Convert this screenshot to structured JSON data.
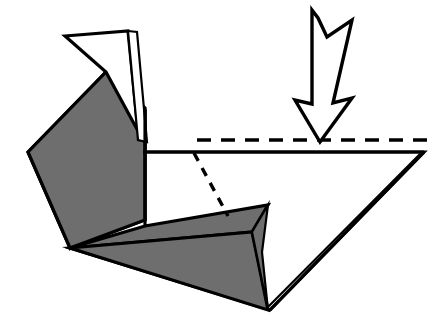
{
  "figure": {
    "kind": "origami-fold-diagram",
    "width": 440,
    "height": 335,
    "background_color": "#ffffff"
  },
  "palette": {
    "paper_shaded": "#6e6e6e",
    "paper_white": "#ffffff",
    "outline": "#000000",
    "arrow_fill": "#ffffff",
    "arrow_stroke": "#000000",
    "crease_dashed": "#000000"
  },
  "strokes": {
    "outline_width": 3.2,
    "thin_width": 2.2,
    "dash_pattern_horizontal": "14 10",
    "dash_pattern_diagonal": "9 8",
    "dash_width": 3.4
  },
  "shapes": {
    "shaded_body": {
      "name": "shaded-main-body",
      "fill": "#6e6e6e",
      "points": "28,152 106,72 145,108 145,220 70,248"
    },
    "shaded_body_upper_wedge": {
      "name": "shaded-upper-wedge",
      "fill": "#6e6e6e",
      "points": "70,248 28,152 106,72 145,110 145,152"
    },
    "white_flap_outer": {
      "name": "white-top-flap",
      "fill": "#ffffff",
      "points": "65,36 128,31 138,131 106,72"
    },
    "white_flap_sliver": {
      "name": "white-flap-sliver",
      "fill": "#ffffff",
      "points": "128,31 137,32 147,142 138,140"
    },
    "white_lower_body": {
      "name": "white-lower-body",
      "fill": "#ffffff",
      "points": "145,152 424,152 270,310 70,248 145,220"
    },
    "shaded_lower_fin_upper": {
      "name": "shaded-lower-fin-upper",
      "fill": "#6e6e6e",
      "points": "70,248 145,226 268,205 252,232"
    },
    "shaded_lower_fin_lower": {
      "name": "shaded-lower-fin-lower",
      "fill": "#6e6e6e",
      "points": "70,248 252,232 268,310"
    },
    "shaded_fin_tip": {
      "name": "shaded-fin-tip",
      "fill": "#6e6e6e",
      "points": "268,205 252,232 268,310 262,252"
    }
  },
  "lines": {
    "horizontal_crease_dashed": {
      "name": "horizontal-crease-line",
      "x1": 197,
      "y1": 140,
      "x2": 430,
      "y2": 140
    },
    "diagonal_crease_dashed": {
      "name": "diagonal-crease-line",
      "x1": 194,
      "y1": 153,
      "x2": 228,
      "y2": 216
    },
    "top_edge": {
      "name": "top-horizontal-edge",
      "x1": 143,
      "y1": 152,
      "x2": 424,
      "y2": 152
    },
    "right_slope_edge": {
      "name": "right-slope-edge",
      "x1": 424,
      "y1": 152,
      "x2": 270,
      "y2": 310
    },
    "inner_right_slope_edge": {
      "name": "inner-right-slope-edge",
      "x1": 421,
      "y1": 153,
      "x2": 266,
      "y2": 309
    },
    "flap_vertical_edge": {
      "name": "flap-vertical-edge",
      "x1": 145,
      "y1": 110,
      "x2": 145,
      "y2": 226
    }
  },
  "arrow": {
    "name": "push-fold-arrow",
    "direction": "down",
    "style": "hollow-outline-pleat-arrow",
    "fill": "#ffffff",
    "stroke": "#000000",
    "stroke_width": 3.4,
    "points": "312,10 312,104 295,100 320,142 352,98 333,103 352,20 327,37 318,18"
  },
  "labels": {
    "alt_text": "A folded paper model shown from the side: a grey shaded body on the left with a white triangular flap on top, a horizontal dashed crease line across the upper right, a dashed diagonal crease inside the white lower region, grey fin shapes at the bottom, and a large hollow downward arrow indicating a push fold."
  }
}
